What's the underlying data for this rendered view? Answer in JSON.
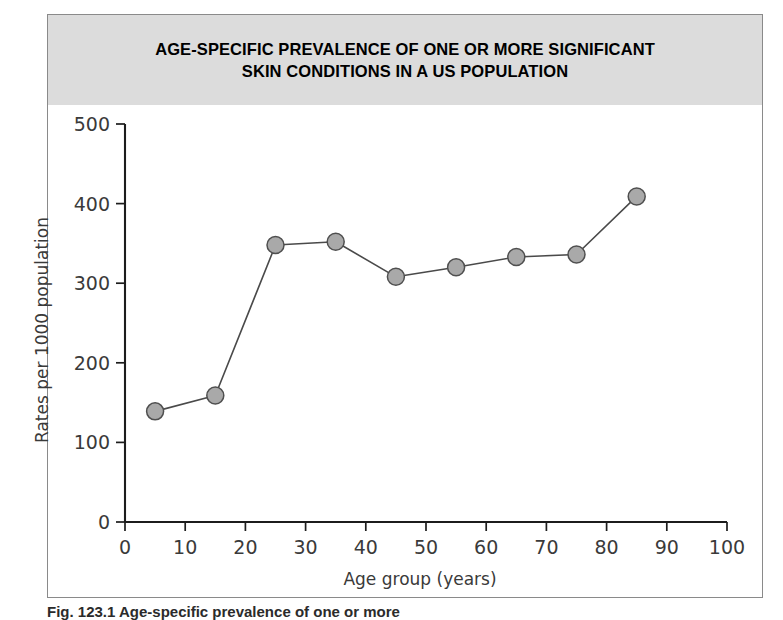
{
  "figure": {
    "title_line1": "AGE-SPECIFIC PREVALENCE OF ONE OR MORE SIGNIFICANT",
    "title_line2": "SKIN CONDITIONS IN A US POPULATION",
    "caption": "Fig. 123.1  Age-specific prevalence of one or more",
    "band_color": "#dcdcdc",
    "frame_color": "#8a8a8a",
    "marker_fill": "#a9a9a9",
    "marker_stroke": "#4f4f4f",
    "line_color": "#4a4a4a",
    "axis_color": "#1c1c1c"
  },
  "chart_data": {
    "type": "line",
    "title": "AGE-SPECIFIC PREVALENCE OF ONE OR MORE SIGNIFICANT SKIN CONDITIONS IN A US POPULATION",
    "xlabel": "Age group (years)",
    "ylabel": "Rates per 1000 population",
    "x": [
      5,
      15,
      25,
      35,
      45,
      55,
      65,
      75,
      85
    ],
    "values": [
      139,
      159,
      348,
      352,
      308,
      320,
      333,
      336,
      409
    ],
    "xlim": [
      0,
      100
    ],
    "ylim": [
      0,
      500
    ],
    "xticks": [
      0,
      10,
      20,
      30,
      40,
      50,
      60,
      70,
      80,
      90,
      100
    ],
    "yticks": [
      0,
      100,
      200,
      300,
      400,
      500
    ],
    "grid": false,
    "legend": false,
    "marker": "circle"
  }
}
